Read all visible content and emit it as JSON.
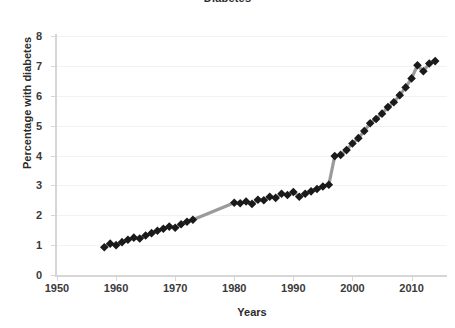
{
  "chart_data": {
    "type": "line",
    "title": "Diabetes",
    "xlabel": "Years",
    "ylabel": "Percentage with diabetes",
    "xlim": [
      1950,
      2016
    ],
    "ylim": [
      0,
      8
    ],
    "xticks": [
      1950,
      1960,
      1970,
      1980,
      1990,
      2000,
      2010
    ],
    "yticks": [
      0,
      1,
      2,
      3,
      4,
      5,
      6,
      7,
      8
    ],
    "grid": true,
    "legend": "none",
    "marker": "diamond",
    "marker_color": "#1a1a1a",
    "line_color": "#9b9b9b",
    "annotation": "Series has a gap with no markers between 1973 and 1979, and a discontinuous jump from about 3.0 to 4.0 between 1996 and 1997.",
    "series": [
      {
        "name": "Percentage with diabetes",
        "x": [
          1958,
          1959,
          1960,
          1961,
          1962,
          1963,
          1964,
          1965,
          1966,
          1967,
          1968,
          1969,
          1970,
          1971,
          1972,
          1973,
          1980,
          1981,
          1982,
          1983,
          1984,
          1985,
          1986,
          1987,
          1988,
          1989,
          1990,
          1991,
          1992,
          1993,
          1994,
          1995,
          1996,
          1997,
          1998,
          1999,
          2000,
          2001,
          2002,
          2003,
          2004,
          2005,
          2006,
          2007,
          2008,
          2009,
          2010,
          2011,
          2012,
          2013,
          2014
        ],
        "values": [
          0.93,
          1.05,
          1.0,
          1.1,
          1.18,
          1.25,
          1.22,
          1.32,
          1.4,
          1.48,
          1.55,
          1.62,
          1.58,
          1.7,
          1.78,
          1.85,
          2.42,
          2.4,
          2.46,
          2.38,
          2.52,
          2.5,
          2.62,
          2.58,
          2.72,
          2.68,
          2.78,
          2.62,
          2.72,
          2.8,
          2.88,
          2.96,
          3.02,
          3.98,
          4.02,
          4.18,
          4.4,
          4.58,
          4.82,
          5.08,
          5.22,
          5.4,
          5.62,
          5.78,
          6.02,
          6.28,
          6.58,
          7.02,
          6.82,
          7.08,
          7.16
        ]
      }
    ]
  }
}
